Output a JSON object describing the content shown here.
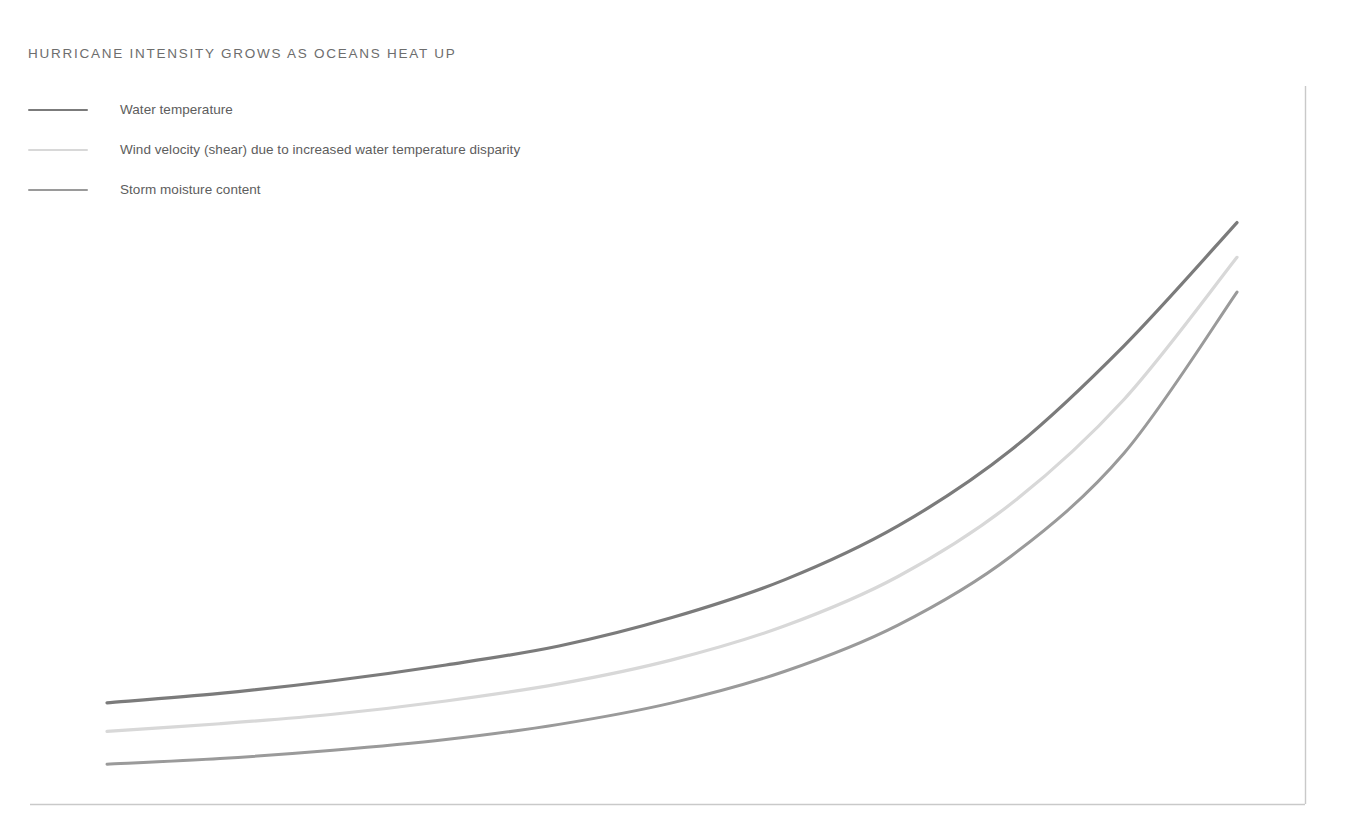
{
  "title": "HURRICANE INTENSITY GROWS AS OCEANS HEAT UP",
  "colors": {
    "background": "#ffffff",
    "title_text": "#6d6d6d",
    "legend_text": "#5d5d5d",
    "axis": "#c9c9c9",
    "series_water_temperature": "#7b7b7b",
    "series_wind_velocity": "#d8d8d8",
    "series_storm_moisture": "#9a9a9a"
  },
  "legend": {
    "position": "top-left",
    "items": [
      {
        "label": "Water temperature",
        "color": "#7b7b7b"
      },
      {
        "label": "Wind velocity (shear) due to increased water temperature disparity",
        "color": "#d8d8d8"
      },
      {
        "label": "Storm moisture content",
        "color": "#9a9a9a"
      }
    ]
  },
  "chart_data": {
    "type": "line",
    "title": "HURRICANE INTENSITY GROWS AS OCEANS HEAT UP",
    "xlabel": "",
    "ylabel": "",
    "xlim": [
      0,
      100
    ],
    "ylim": [
      0,
      100
    ],
    "grid": false,
    "axis_ticks": false,
    "axes_shown": [
      "bottom",
      "right"
    ],
    "legend_position": "top-left",
    "annotations": [],
    "x": [
      0,
      10,
      20,
      30,
      40,
      50,
      60,
      70,
      80,
      90,
      100
    ],
    "series": [
      {
        "name": "Water temperature",
        "color": "#7b7b7b",
        "values": [
          16,
          17.5,
          19.5,
          22,
          25,
          29.5,
          35.5,
          44,
          56,
          72.5,
          92
        ]
      },
      {
        "name": "Wind velocity (shear) due to increased water temperature disparity",
        "color": "#d8d8d8",
        "values": [
          11.5,
          12.7,
          14.2,
          16.3,
          19,
          22.8,
          28.2,
          36,
          47.5,
          64,
          86.5
        ]
      },
      {
        "name": "Storm moisture content",
        "color": "#9a9a9a",
        "values": [
          6.3,
          7.2,
          8.5,
          10.2,
          12.6,
          16,
          21,
          28.3,
          39.2,
          55.5,
          81
        ]
      }
    ]
  }
}
